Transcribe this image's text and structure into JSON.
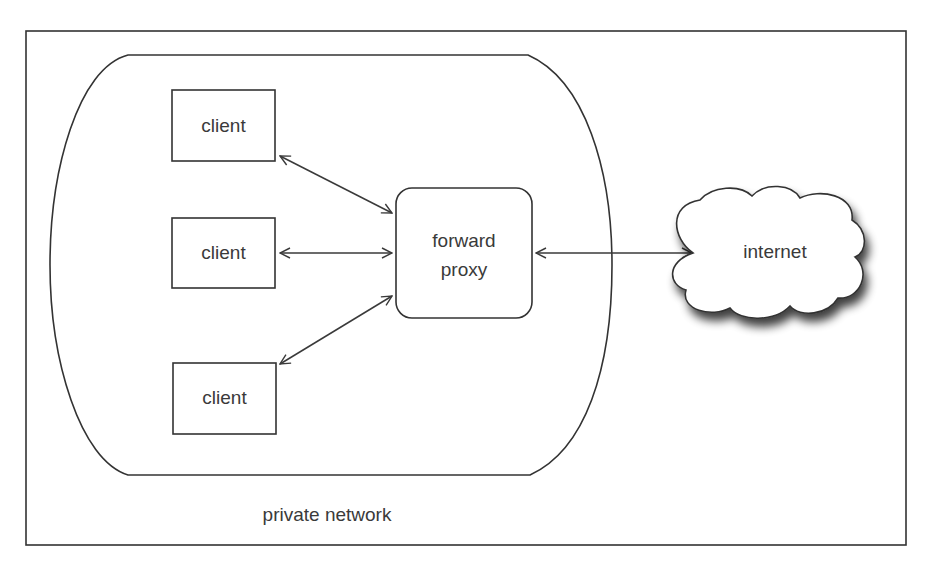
{
  "diagram": {
    "private_network": {
      "label": "private network"
    },
    "clients": [
      {
        "label": "client"
      },
      {
        "label": "client"
      },
      {
        "label": "client"
      }
    ],
    "proxy": {
      "line1": "forward",
      "line2": "proxy"
    },
    "internet": {
      "label": "internet"
    },
    "connections": [
      {
        "from": "client 1",
        "to": "forward proxy",
        "direction": "bidirectional"
      },
      {
        "from": "client 2",
        "to": "forward proxy",
        "direction": "bidirectional"
      },
      {
        "from": "client 3",
        "to": "forward proxy",
        "direction": "bidirectional"
      },
      {
        "from": "forward proxy",
        "to": "internet",
        "direction": "bidirectional"
      }
    ]
  },
  "colors": {
    "line": "#333333",
    "text": "#3a3a3a",
    "background": "#ffffff"
  }
}
